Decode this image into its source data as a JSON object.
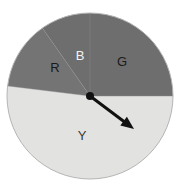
{
  "figure": {
    "type": "spinner-pie-diagram",
    "background_color": "#ffffff",
    "circle": {
      "center_x": 90,
      "center_y": 96,
      "radius": 83,
      "outline_color": "#b5b5b5"
    },
    "pointer": {
      "name": "spinner-arrow",
      "pivot_x": 90,
      "pivot_y": 96,
      "tip_x": 134,
      "tip_y": 129,
      "angle_degrees": 37,
      "color": "#111111",
      "hub_radius": 4
    }
  },
  "chart_data": {
    "type": "pie",
    "title": "",
    "xlabel": "",
    "ylabel": "",
    "legend": "none",
    "grid": false,
    "categories": [
      "B",
      "G",
      "Y",
      "R"
    ],
    "values": [
      35,
      90,
      187,
      48
    ],
    "unit": "degrees",
    "slices": [
      {
        "label": "B",
        "name": "blue-sector",
        "start_angle": -125,
        "end_angle": -90,
        "sweep_degrees": 35,
        "fill": "#6e6e6e",
        "label_color": "#f2f2f2",
        "label_x": 80,
        "label_y": 57
      },
      {
        "label": "G",
        "name": "green-sector",
        "start_angle": -90,
        "end_angle": 0,
        "sweep_degrees": 90,
        "fill": "#6e6e6e",
        "label_color": "#1a1a1a",
        "label_x": 122,
        "label_y": 63
      },
      {
        "label": "Y",
        "name": "yellow-sector",
        "start_angle": 0,
        "end_angle": 187,
        "sweep_degrees": 187,
        "fill": "#e2e2e0",
        "label_color": "#3a3a3a",
        "label_x": 82,
        "label_y": 137
      },
      {
        "label": "R",
        "name": "red-sector",
        "start_angle": 187,
        "end_angle": 235,
        "sweep_degrees": 48,
        "fill": "#747474",
        "label_color": "#1a1a1a",
        "label_x": 55,
        "label_y": 69
      }
    ],
    "divider_color": "#8a8a8a"
  }
}
